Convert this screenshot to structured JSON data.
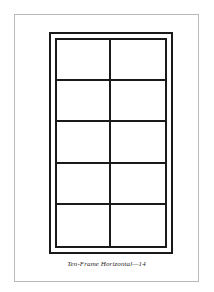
{
  "page": {
    "background_color": "#ffffff",
    "border_color": "#b9b9b9"
  },
  "figure": {
    "name": "ten-frame-horizontal",
    "rows": 5,
    "columns": 2,
    "total_cells": 10,
    "line_color": "#1a1a1a",
    "cell_fill": "#ffffff",
    "frame_style": "double",
    "cells": [
      {
        "row": 1,
        "column": 1,
        "content": ""
      },
      {
        "row": 1,
        "column": 2,
        "content": ""
      },
      {
        "row": 2,
        "column": 1,
        "content": ""
      },
      {
        "row": 2,
        "column": 2,
        "content": ""
      },
      {
        "row": 3,
        "column": 1,
        "content": ""
      },
      {
        "row": 3,
        "column": 2,
        "content": ""
      },
      {
        "row": 4,
        "column": 1,
        "content": ""
      },
      {
        "row": 4,
        "column": 2,
        "content": ""
      },
      {
        "row": 5,
        "column": 1,
        "content": ""
      },
      {
        "row": 5,
        "column": 2,
        "content": ""
      }
    ]
  },
  "caption": {
    "text": "Ten-Frame Horizontal—14"
  }
}
